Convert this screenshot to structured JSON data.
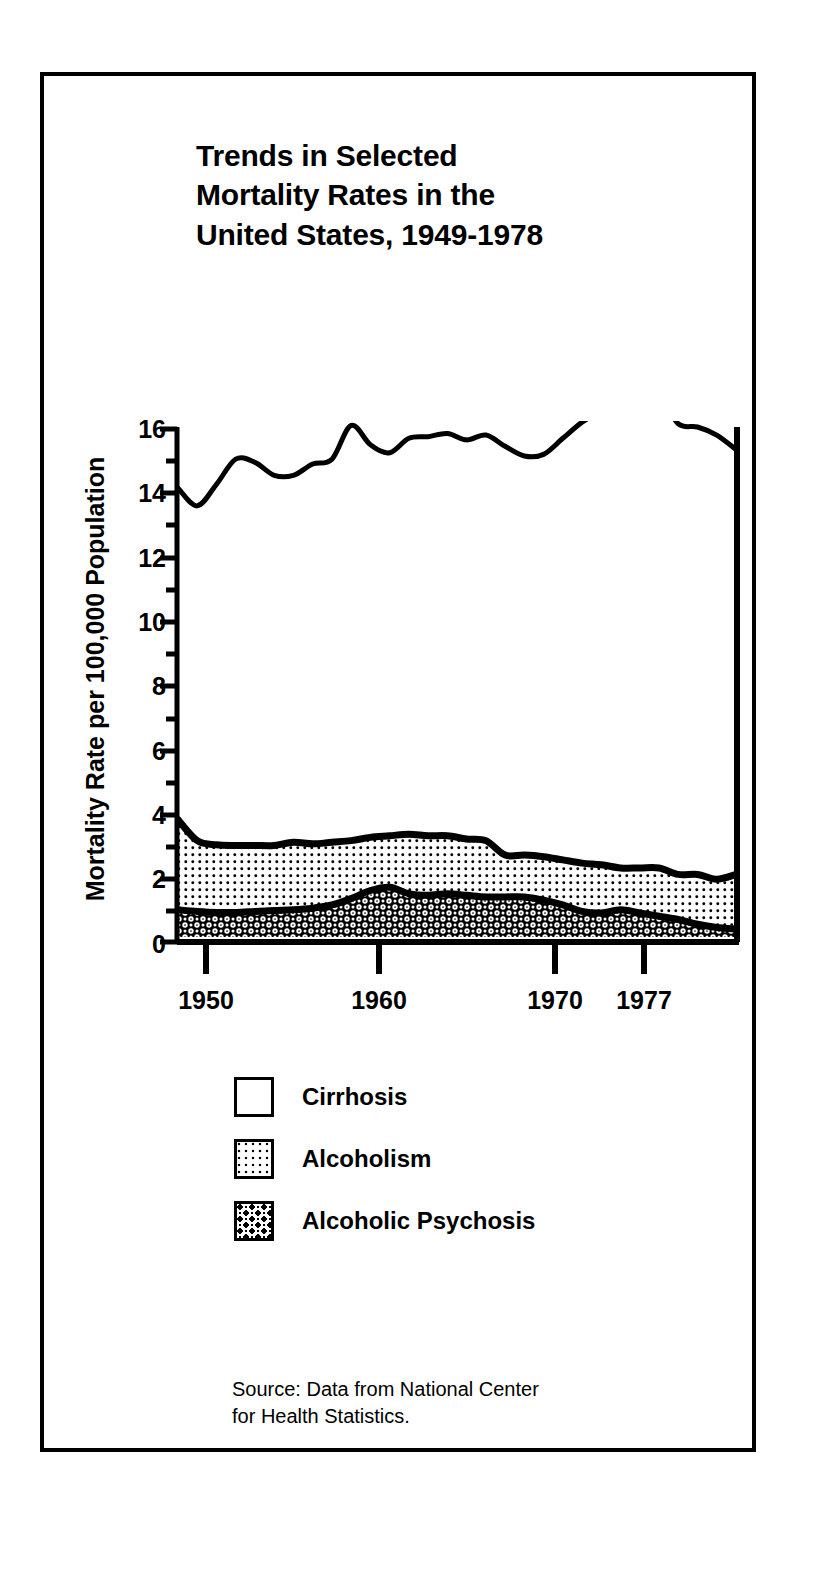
{
  "figure": {
    "title_lines": [
      "Trends in Selected",
      "Mortality Rates in the",
      "United States, 1949-1978"
    ],
    "source_lines": [
      "Source: Data from National Center",
      "for Health Statistics."
    ],
    "border_color": "#000000",
    "background_color": "#ffffff"
  },
  "legend": {
    "items": [
      {
        "label": "Cirrhosis",
        "pattern": "blank-white",
        "swatch_class": "swatch-cirrhosis"
      },
      {
        "label": "Alcoholism",
        "pattern": "fine-dots",
        "swatch_class": "swatch-alcoholism"
      },
      {
        "label": "Alcoholic Psychosis",
        "pattern": "dense-ornament",
        "swatch_class": "swatch-psychosis"
      }
    ]
  },
  "chart_data": {
    "type": "area",
    "stacked": true,
    "title": "Trends in Selected Mortality Rates in the United States, 1949-1978",
    "xlabel": "",
    "ylabel": "Mortality Rate per 100,000 Population",
    "xlim": [
      1949,
      1978
    ],
    "ylim": [
      0,
      16
    ],
    "ytick_labels": [
      "0",
      "2",
      "4",
      "6",
      "8",
      "10",
      "12",
      "14",
      "16"
    ],
    "ytick_values": [
      0,
      2,
      4,
      6,
      8,
      10,
      12,
      14,
      16
    ],
    "yminor_step": 1,
    "xtick_labels": [
      "1950",
      "1960",
      "1970",
      "1977"
    ],
    "xtick_values": [
      1950,
      1960,
      1970,
      1977
    ],
    "grid": false,
    "legend_position": "below-plot",
    "x": [
      1949,
      1950,
      1951,
      1952,
      1953,
      1954,
      1955,
      1956,
      1957,
      1958,
      1959,
      1960,
      1961,
      1962,
      1963,
      1964,
      1965,
      1966,
      1967,
      1968,
      1969,
      1970,
      1971,
      1972,
      1973,
      1974,
      1975,
      1976,
      1977,
      1978
    ],
    "series": [
      {
        "name": "Alcoholic Psychosis",
        "order": 1,
        "fill": "dense-ornament",
        "values": [
          1.0,
          0.95,
          0.92,
          0.92,
          0.95,
          0.98,
          1.0,
          1.05,
          1.15,
          1.35,
          1.6,
          1.7,
          1.5,
          1.45,
          1.5,
          1.45,
          1.4,
          1.4,
          1.4,
          1.3,
          1.15,
          0.95,
          0.9,
          1.0,
          0.9,
          0.8,
          0.7,
          0.55,
          0.45,
          0.4
        ]
      },
      {
        "name": "Alcoholism",
        "order": 2,
        "fill": "fine-dots",
        "values": [
          2.8,
          2.2,
          2.1,
          2.08,
          2.05,
          2.02,
          2.1,
          2.0,
          1.95,
          1.8,
          1.65,
          1.6,
          1.85,
          1.85,
          1.8,
          1.75,
          1.75,
          1.3,
          1.3,
          1.35,
          1.4,
          1.5,
          1.5,
          1.3,
          1.4,
          1.5,
          1.4,
          1.55,
          1.5,
          1.7
        ]
      },
      {
        "name": "Cirrhosis",
        "order": 3,
        "fill": "blank-white",
        "values": [
          10.3,
          10.4,
          11.2,
          12.0,
          11.9,
          11.5,
          11.4,
          11.8,
          11.9,
          12.9,
          12.2,
          11.9,
          12.3,
          12.4,
          12.5,
          12.4,
          12.6,
          12.7,
          12.4,
          12.5,
          13.1,
          13.7,
          14.1,
          14.6,
          14.8,
          14.7,
          14.0,
          13.9,
          13.8,
          13.2
        ]
      }
    ],
    "cirrhosis_top_total": [
      14.1,
      13.55,
      14.22,
      15.0,
      14.9,
      14.5,
      14.5,
      14.85,
      15.0,
      16.05,
      15.45,
      15.2,
      15.65,
      15.7,
      15.8,
      15.6,
      15.75,
      15.4,
      15.1,
      15.15,
      15.65,
      16.15,
      16.5,
      16.9,
      17.1,
      17.0,
      16.1,
      16.0,
      15.75,
      15.3
    ]
  }
}
